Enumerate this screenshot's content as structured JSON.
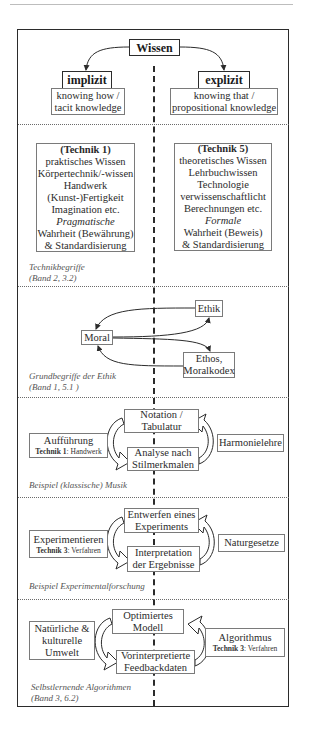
{
  "top": {
    "root": "Wissen",
    "left": {
      "label": "implizit",
      "desc_lines": [
        "knowing how /",
        "tacit knowledge"
      ]
    },
    "right": {
      "label": "explizit",
      "desc_lines": [
        "knowing that /",
        "propositional knowledge"
      ]
    }
  },
  "technik": {
    "left": {
      "heading": "(Technik 1)",
      "lines": [
        "praktisches Wissen",
        "Körpertechnik/-wissen",
        "Handwerk",
        "(Kunst-)Fertigkeit",
        "Imagination etc."
      ],
      "italic": "Pragmatische",
      "tail": [
        "Wahrheit (Bewährung)",
        "& Standardisierung"
      ]
    },
    "right": {
      "heading": "(Technik 5)",
      "lines": [
        "theoretisches Wissen",
        "Lehrbuchwissen",
        "Technologie",
        "verwissenschaftlicht",
        "Berechnungen etc."
      ],
      "italic": "Formale",
      "tail": [
        "Wahrheit (Beweis)",
        "& Standardisierung"
      ]
    },
    "caption": [
      "Technikbegriffe",
      "(Band 2, 3.2)"
    ]
  },
  "ethik": {
    "moral": "Moral",
    "ethik": "Ethik",
    "ethos_lines": [
      "Ethos,",
      "Moralkodex"
    ],
    "caption": [
      "Grundbegriffe der Ethik",
      "(Band 1, 5.1 )"
    ]
  },
  "musik": {
    "top_lines": [
      "Notation /",
      "Tabulatur"
    ],
    "bottom_lines": [
      "Analyse nach",
      "Stilmerkmalen"
    ],
    "left_title": "Aufführung",
    "left_tech_bold": "Technik 1",
    "left_tech_rest": ": Handwerk",
    "right": "Harmonielehre",
    "caption": "Beispiel (klassische) Musik"
  },
  "experiment": {
    "top_lines": [
      "Entwerfen eines",
      "Experiments"
    ],
    "bottom_lines": [
      "Interpretation",
      "der Ergebnisse"
    ],
    "left_title": "Experimentieren",
    "left_tech_bold": "Technik 3",
    "left_tech_rest": ": Verfahren",
    "right": "Naturgesetze",
    "caption": "Beispiel Experimentalforschung"
  },
  "algorithmus": {
    "top_lines": [
      "Optimiertes",
      "Modell"
    ],
    "bottom_lines": [
      "Vorinterpretierte",
      "Feedbackdaten"
    ],
    "left_lines": [
      "Natürliche &",
      "kulturelle",
      "Umwelt"
    ],
    "right_title": "Algorithmus",
    "right_tech_bold": "Technik 3",
    "right_tech_rest": ": Verfahren",
    "caption": [
      "Selbstlernende Algorithmen",
      "(Band 3, 6.2)"
    ]
  },
  "colors": {
    "line": "#2b2b2b",
    "box_border": "#7a7a7a",
    "caption": "#555555",
    "dotted": "#6b6b6b"
  }
}
